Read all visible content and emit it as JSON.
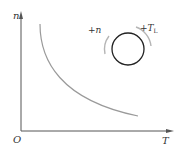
{
  "diagram": {
    "type": "characteristic-curve",
    "axes": {
      "y_label": "n",
      "x_label": "T",
      "origin_label": "O"
    },
    "curve": {
      "description": "decreasing hyperbola-like curve of n versus T"
    },
    "inset": {
      "shape": "circle",
      "left_arrow_label": "+n",
      "right_arrow_label_main": "+T",
      "right_arrow_label_sub": "L"
    },
    "colors": {
      "axis": "#555555",
      "curve": "#9a9a9a",
      "circle": "#222222",
      "arrows": "#b5b5b5",
      "text": "#333333"
    }
  }
}
